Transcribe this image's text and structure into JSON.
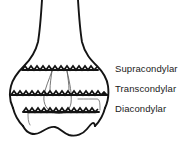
{
  "figure": {
    "background_color": "#ffffff",
    "ink_color": "#141414"
  },
  "labels": [
    {
      "id": "supracondylar",
      "text": "Supracondylar"
    },
    {
      "id": "transcondylar",
      "text": "Transcondylar"
    },
    {
      "id": "diacondylar",
      "text": "Diacondylar"
    }
  ],
  "fracture_lines": [
    {
      "name": "supracondylar-fracture-line",
      "label": "Supracondylar",
      "style": "jagged",
      "y": 70,
      "x_start": 22,
      "x_end": 98
    },
    {
      "name": "transcondylar-fracture-line",
      "label": "Transcondylar",
      "style": "jagged",
      "y": 95,
      "x_start": 10,
      "x_end": 108
    },
    {
      "name": "diacondylar-fracture-line",
      "label": "Diacondylar",
      "style": "jagged",
      "y": 112,
      "x_start": 22,
      "x_end": 100
    }
  ],
  "anatomy": {
    "shaft": "humeral shaft",
    "fossa": "olecranon fossa",
    "condyles": "medial and lateral condyles",
    "trochlea": "trochlea and capitulum wavy articular margin"
  }
}
